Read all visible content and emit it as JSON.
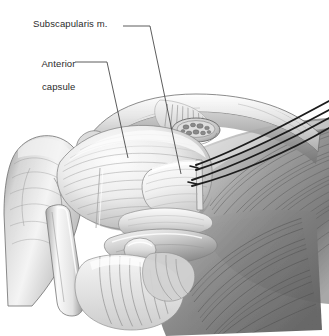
{
  "figure": {
    "kind": "medical-illustration",
    "background_color": "#ffffff",
    "width": 329,
    "height": 336,
    "style": "grayscale pen-and-ink / airbrush medical drawing"
  },
  "labels": [
    {
      "id": "subscapularis",
      "text": "Subscapularis m.",
      "text_x": 33,
      "text_y": 18,
      "leader": {
        "x1": 123,
        "y1": 26,
        "x2": 150,
        "y2": 26,
        "x3": 181,
        "y3": 174
      }
    },
    {
      "id": "anterior_capsule",
      "text_line1": "Anterior",
      "text_line2": "capsule",
      "text_x": 31,
      "text_y": 46,
      "leader": {
        "x1": 75,
        "y1": 62,
        "x2": 107,
        "y2": 62,
        "x3": 128,
        "y3": 158
      }
    }
  ],
  "colors": {
    "ink": "#2b2b2b",
    "leader_line": "#4a4a4a",
    "suture": "#1c1c1c",
    "shade_light": "#f2f2f2",
    "shade_mid": "#bdbdbd",
    "shade_dark": "#6f6f6f",
    "shade_deep": "#4b4b4b"
  },
  "structures": {
    "clavicle_arch": "Clavicle / coracoacromial arch spanning upper portion",
    "coracoid_cross_section": "Cross-sectioned bundle with visible fascicles below the arch",
    "humeral_head": "Humeral head and greater tuberosity at left",
    "capsule_flap": "Pale reflected anterior capsule flap at center-right",
    "pectoralis_fibers": "Fanning striated muscle fibers filling right and lower field",
    "long_head_biceps": "Tendon strips crossing the lower center",
    "sutures": "Four dark traction suture strands running from capsule flap edge up to the right"
  },
  "sutures": {
    "count": 4,
    "color": "#1c1c1c",
    "paths": [
      {
        "x1": 196,
        "y1": 165,
        "x2": 329,
        "y2": 101
      },
      {
        "x1": 196,
        "y1": 170,
        "x2": 329,
        "y2": 110
      },
      {
        "x1": 192,
        "y1": 180,
        "x2": 329,
        "y2": 118
      },
      {
        "x1": 192,
        "y1": 186,
        "x2": 329,
        "y2": 128
      }
    ]
  }
}
